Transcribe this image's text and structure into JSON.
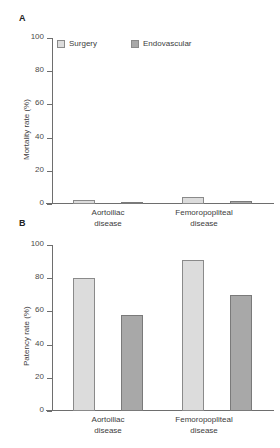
{
  "figure": {
    "panels": [
      {
        "letter": "A"
      },
      {
        "letter": "B"
      }
    ]
  },
  "legend": {
    "items": [
      {
        "label": "Surgery",
        "color": "#dcdcdc"
      },
      {
        "label": "Endovascular",
        "color": "#a8a8a8"
      }
    ]
  },
  "chart_data": [
    {
      "type": "bar",
      "panel": "A",
      "title": "",
      "xlabel": "",
      "ylabel": "Mortality rate (%)",
      "ylim": [
        0,
        100
      ],
      "yticks": [
        0,
        20,
        40,
        60,
        80,
        100
      ],
      "ytick_labels": [
        "0",
        "20",
        "40",
        "60",
        "80",
        "100"
      ],
      "grid": false,
      "legend_position": "top-left",
      "categories": [
        "Aortoiliac disease",
        "Femoropopliteal disease"
      ],
      "category_lines": [
        [
          "Aortoiliac",
          "disease"
        ],
        [
          "Femoropopliteal",
          "disease"
        ]
      ],
      "series": [
        {
          "name": "Surgery",
          "color": "#dcdcdc",
          "values": [
            2.5,
            4
          ]
        },
        {
          "name": "Endovascular",
          "color": "#a8a8a8",
          "values": [
            1,
            2
          ]
        }
      ]
    },
    {
      "type": "bar",
      "panel": "B",
      "title": "",
      "xlabel": "",
      "ylabel": "Patency rate (%)",
      "ylim": [
        0,
        100
      ],
      "yticks": [
        0,
        20,
        40,
        60,
        80,
        100
      ],
      "ytick_labels": [
        "0",
        "20",
        "40",
        "60",
        "80",
        "100"
      ],
      "grid": false,
      "legend_position": "none",
      "categories": [
        "Aortoiliac disease",
        "Femoropopliteal disease"
      ],
      "category_lines": [
        [
          "Aortoiliac",
          "disease"
        ],
        [
          "Femoropopliteal",
          "disease"
        ]
      ],
      "series": [
        {
          "name": "Surgery",
          "color": "#dcdcdc",
          "values": [
            80,
            91
          ]
        },
        {
          "name": "Endovascular",
          "color": "#a8a8a8",
          "values": [
            58,
            70
          ]
        }
      ]
    }
  ]
}
